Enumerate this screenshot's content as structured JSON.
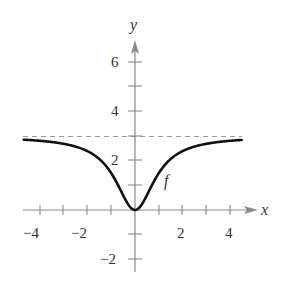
{
  "chart_data": {
    "type": "line",
    "title": "",
    "xlabel": "x",
    "ylabel": "y",
    "xlim": [
      -4.7,
      4.7
    ],
    "ylim": [
      -2.6,
      7.3
    ],
    "x_ticks": [
      -4,
      -3,
      -2,
      -1,
      1,
      2,
      3,
      4
    ],
    "x_tick_labels": [
      "-4",
      "-2",
      "2",
      "4"
    ],
    "x_tick_label_values": [
      -4,
      -2,
      2,
      4
    ],
    "y_ticks": [
      -2,
      -1,
      1,
      2,
      3,
      4,
      5,
      6
    ],
    "y_tick_labels": [
      "-2",
      "2",
      "4",
      "6"
    ],
    "y_tick_label_values": [
      -2,
      2,
      4,
      6
    ],
    "grid": false,
    "legend": null,
    "series": [
      {
        "name": "f",
        "label": "f",
        "formula": "3x^2/(x^2+1)",
        "x": [
          -4.7,
          -4,
          -3,
          -2,
          -1.5,
          -1,
          -0.5,
          0,
          0.5,
          1,
          1.5,
          2,
          3,
          4,
          4.5
        ],
        "values": [
          2.87,
          2.82,
          2.7,
          2.4,
          2.08,
          1.5,
          0.6,
          0,
          0.6,
          1.5,
          2.08,
          2.4,
          2.7,
          2.82,
          2.86
        ]
      }
    ],
    "annotations": [
      {
        "type": "horizontal_asymptote",
        "y": 3,
        "style": "dashed"
      },
      {
        "type": "curve_label",
        "text": "f",
        "x": 1.3,
        "y": 1.1
      }
    ]
  },
  "labels": {
    "x_axis": "x",
    "y_axis": "y",
    "curve": "f",
    "xt": [
      "−4",
      "−2",
      "2",
      "4"
    ],
    "yt": [
      "6",
      "4",
      "2",
      "−2"
    ]
  }
}
